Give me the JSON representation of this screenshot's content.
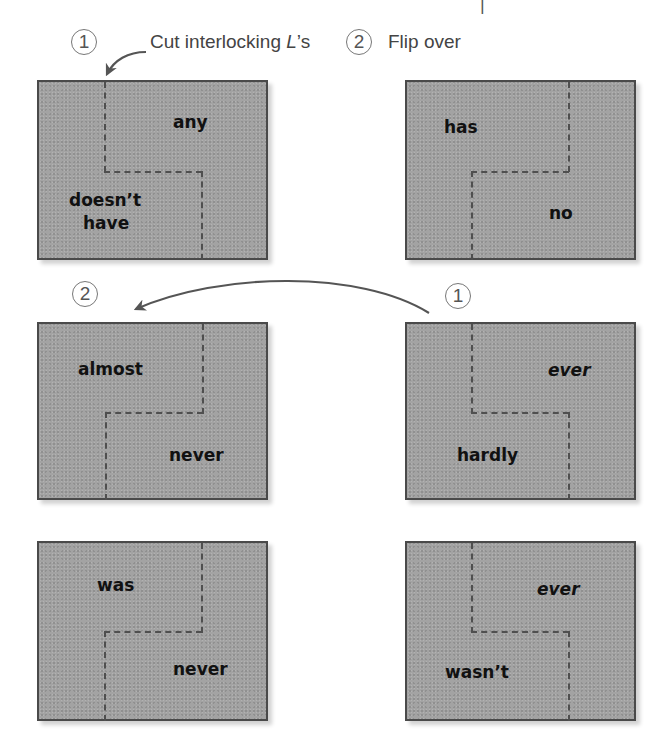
{
  "top_mark": "|",
  "steps": {
    "step1": {
      "number": "1",
      "caption_pre": "Cut interlocking ",
      "caption_em": "L",
      "caption_post": "’s"
    },
    "step2": {
      "number": "2",
      "caption": "Flip over"
    },
    "middle_left_number": "2",
    "middle_right_number": "1"
  },
  "cards": [
    {
      "id": "card-1",
      "words": [
        "any",
        "doesn’t",
        "have"
      ]
    },
    {
      "id": "card-2",
      "words": [
        "has",
        "no"
      ]
    },
    {
      "id": "card-3",
      "words": [
        "almost",
        "never"
      ]
    },
    {
      "id": "card-4",
      "words": [
        "ever",
        "hardly"
      ]
    },
    {
      "id": "card-5",
      "words": [
        "was",
        "never"
      ]
    },
    {
      "id": "card-6",
      "words": [
        "ever",
        "wasn’t"
      ]
    }
  ],
  "colors": {
    "card_fill": "#a3a3a3",
    "card_border": "#4a4a4a",
    "dash": "#4f4f4f",
    "arrow": "#555555",
    "circle": "#777777"
  }
}
